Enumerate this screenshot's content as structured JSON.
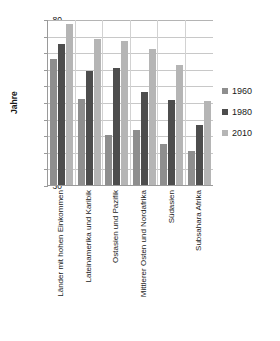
{
  "chart_data": {
    "type": "bar",
    "title": "",
    "xlabel": "",
    "ylabel": "Jahre",
    "ylim": [
      30,
      80
    ],
    "ytick_step": 5,
    "yticks": [
      80,
      75,
      70,
      65,
      60,
      55,
      50,
      45,
      40,
      35,
      30
    ],
    "grid": true,
    "legend_position": "right",
    "categories": [
      "Länder mit hohen Einkommen",
      "Lateinamerika und Karibik",
      "Ostasien und Pazifik",
      "Mittlerer Osten und Nordafrika",
      "Südasien",
      "Subsahara Afrika"
    ],
    "series": [
      {
        "name": "1960",
        "color": "#8e8e8e",
        "values": [
          68.0,
          56.0,
          45.1,
          46.6,
          42.4,
          40.1
        ]
      },
      {
        "name": "1980",
        "color": "#4d4d4d",
        "values": [
          72.5,
          64.3,
          65.3,
          58.1,
          55.5,
          48.2
        ]
      },
      {
        "name": "2010",
        "color": "#b5b5b5",
        "values": [
          78.6,
          74.1,
          73.5,
          71.0,
          66.1,
          55.3
        ]
      }
    ]
  },
  "legend": {
    "items": [
      {
        "label": "1960"
      },
      {
        "label": "1980"
      },
      {
        "label": "2010"
      }
    ]
  }
}
